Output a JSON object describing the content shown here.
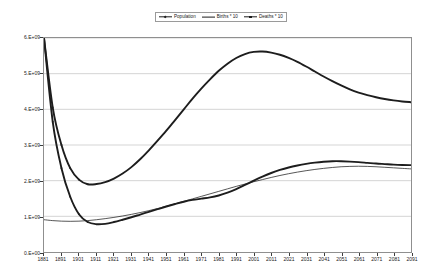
{
  "legend": {
    "position": "top-center",
    "entries": [
      {
        "label": "Population",
        "marker": "diamond",
        "line": "thick"
      },
      {
        "label": "Births * 10",
        "marker": "none",
        "line": "thin"
      },
      {
        "label": "Deaths * 10",
        "marker": "square",
        "line": "thick"
      }
    ]
  },
  "chart_data": {
    "type": "line",
    "title": "",
    "xlabel": "",
    "ylabel": "",
    "grid": true,
    "legend_position": "top-center",
    "xlim": [
      1881,
      2091
    ],
    "ylim": [
      0,
      6000000000
    ],
    "x_tick_labels": [
      "1881",
      "1891",
      "1901",
      "1911",
      "1921",
      "1931",
      "1941",
      "1951",
      "1961",
      "1971",
      "1981",
      "1991",
      "2001",
      "2011",
      "2021",
      "2031",
      "2041",
      "2051",
      "2061",
      "2071",
      "2081",
      "2091"
    ],
    "y_tick_labels": [
      "0.E+00",
      "1.E+09",
      "2.E+09",
      "3.E+09",
      "4.E+09",
      "5.E+09",
      "6.E+09"
    ],
    "y_tick_values": [
      0,
      1000000000,
      2000000000,
      3000000000,
      4000000000,
      5000000000,
      6000000000
    ],
    "x": [
      1881,
      1886,
      1891,
      1896,
      1901,
      1906,
      1911,
      1916,
      1921,
      1926,
      1931,
      1936,
      1941,
      1946,
      1951,
      1956,
      1961,
      1966,
      1971,
      1976,
      1981,
      1986,
      1991,
      1996,
      2001,
      2006,
      2011,
      2016,
      2021,
      2026,
      2031,
      2036,
      2041,
      2046,
      2051,
      2056,
      2061,
      2066,
      2071,
      2076,
      2081,
      2086,
      2091
    ],
    "series": [
      {
        "name": "Population",
        "line": "thick",
        "color": "#1d1d1d",
        "values": [
          6000000000,
          4050000000,
          3000000000,
          2350000000,
          2030000000,
          1900000000,
          1905000000,
          1960000000,
          2060000000,
          2200000000,
          2380000000,
          2600000000,
          2850000000,
          3120000000,
          3400000000,
          3700000000,
          4000000000,
          4300000000,
          4580000000,
          4840000000,
          5080000000,
          5280000000,
          5440000000,
          5550000000,
          5610000000,
          5620000000,
          5590000000,
          5530000000,
          5440000000,
          5330000000,
          5200000000,
          5060000000,
          4920000000,
          4790000000,
          4670000000,
          4560000000,
          4470000000,
          4400000000,
          4340000000,
          4290000000,
          4250000000,
          4220000000,
          4200000000
        ]
      },
      {
        "name": "Births * 10",
        "line": "thin",
        "color": "#1d1d1d",
        "values": [
          905000000,
          880000000,
          865000000,
          860000000,
          865000000,
          880000000,
          905000000,
          935000000,
          970000000,
          1010000000,
          1055000000,
          1105000000,
          1160000000,
          1220000000,
          1285000000,
          1350000000,
          1420000000,
          1490000000,
          1560000000,
          1630000000,
          1700000000,
          1770000000,
          1840000000,
          1905000000,
          1970000000,
          2030000000,
          2090000000,
          2145000000,
          2195000000,
          2240000000,
          2280000000,
          2315000000,
          2345000000,
          2370000000,
          2390000000,
          2400000000,
          2405000000,
          2400000000,
          2390000000,
          2375000000,
          2360000000,
          2345000000,
          2330000000
        ]
      },
      {
        "name": "Deaths * 10",
        "line": "thick",
        "color": "#1d1d1d",
        "values": [
          6000000000,
          3650000000,
          2350000000,
          1550000000,
          1060000000,
          840000000,
          780000000,
          790000000,
          840000000,
          905000000,
          975000000,
          1050000000,
          1125000000,
          1200000000,
          1275000000,
          1345000000,
          1410000000,
          1460000000,
          1495000000,
          1530000000,
          1585000000,
          1665000000,
          1765000000,
          1880000000,
          2000000000,
          2115000000,
          2215000000,
          2300000000,
          2370000000,
          2425000000,
          2470000000,
          2505000000,
          2530000000,
          2545000000,
          2545000000,
          2535000000,
          2520000000,
          2500000000,
          2480000000,
          2465000000,
          2450000000,
          2440000000,
          2435000000
        ]
      }
    ],
    "notes": {
      "population_minimum": {
        "x": 1906,
        "y": 1900000000
      },
      "population_peak": {
        "x": 2006,
        "y": 5620000000
      },
      "deaths_minimum": {
        "x": 1911,
        "y": 780000000
      },
      "deaths_peak": {
        "x": 2046,
        "y": 2545000000
      },
      "births_peak": {
        "x": 2061,
        "y": 2405000000
      }
    }
  }
}
